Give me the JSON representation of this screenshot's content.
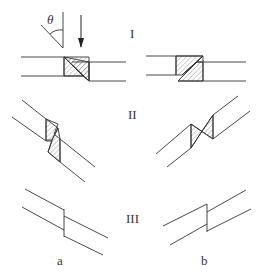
{
  "diagram": {
    "angle_symbol": "θ",
    "row_labels": [
      "I",
      "II",
      "III"
    ],
    "column_labels": [
      "a",
      "b"
    ],
    "colors": {
      "line": "#333333",
      "background": "#ffffff"
    }
  }
}
